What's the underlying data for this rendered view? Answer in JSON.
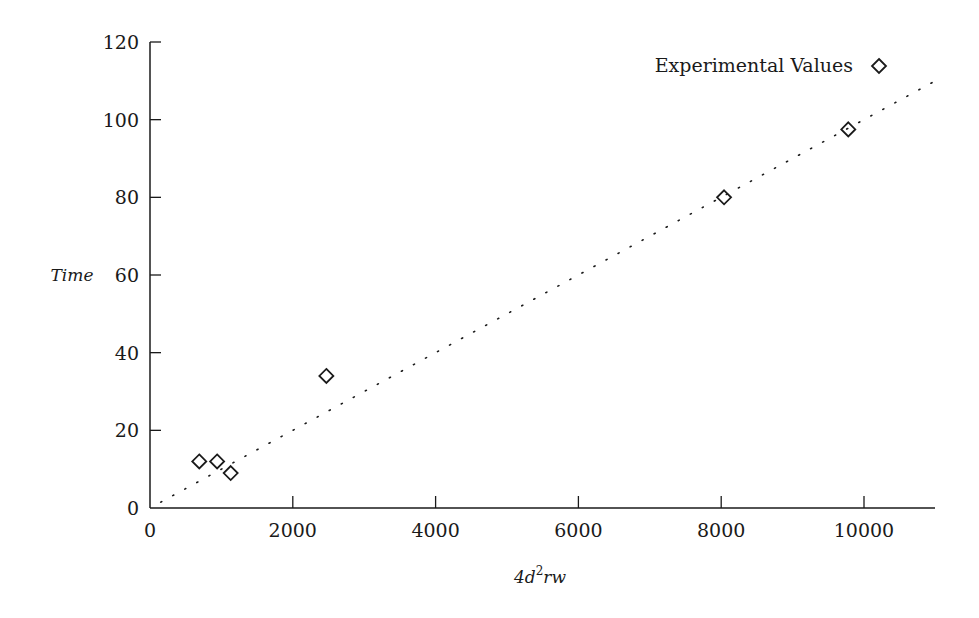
{
  "chart_data": {
    "type": "scatter",
    "title": "",
    "xlabel_parts": [
      "4d",
      "2",
      "rw"
    ],
    "xlabel": "4d^2rw",
    "ylabel": "Time",
    "xlim": [
      0,
      11000
    ],
    "ylim": [
      0,
      120
    ],
    "xticks": [
      0,
      2000,
      4000,
      6000,
      8000,
      10000
    ],
    "yticks": [
      0,
      20,
      40,
      60,
      80,
      100,
      120
    ],
    "grid": false,
    "legend": {
      "position": "top-right",
      "entries": [
        {
          "label": "Experimental Values",
          "marker": "diamond"
        }
      ]
    },
    "series": [
      {
        "name": "Experimental Values",
        "marker": "diamond",
        "points": [
          {
            "x": 690,
            "y": 12
          },
          {
            "x": 940,
            "y": 12
          },
          {
            "x": 1130,
            "y": 9
          },
          {
            "x": 2470,
            "y": 34
          },
          {
            "x": 8040,
            "y": 80
          },
          {
            "x": 9780,
            "y": 97.5
          }
        ]
      }
    ],
    "fit_line": {
      "style": "dotted",
      "slope": 0.01,
      "intercept": 0,
      "x_range": [
        150,
        11000
      ]
    },
    "colors": {
      "ink": "#1a1a1a",
      "background": "#ffffff"
    }
  }
}
